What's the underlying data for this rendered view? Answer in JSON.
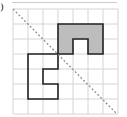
{
  "figure": {
    "label": ")",
    "grid": {
      "cols": 7,
      "rows": 7,
      "origin_x": 13,
      "origin_y": 9,
      "cell": 15,
      "line_color": "#d4d4d4"
    },
    "mirror_line": {
      "style": "dashed",
      "color": "#888888",
      "from": [
        13,
        9
      ],
      "to": [
        117,
        114
      ]
    },
    "shaded_shape": {
      "fill": "#bdbdbd",
      "stroke": "#222222",
      "cells_outline": [
        [
          3,
          1
        ],
        [
          6,
          1
        ],
        [
          6,
          3
        ],
        [
          5,
          3
        ],
        [
          5,
          2
        ],
        [
          4,
          2
        ],
        [
          4,
          3
        ],
        [
          3,
          3
        ]
      ]
    },
    "white_shape": {
      "fill": "none",
      "stroke": "#222222",
      "cells_outline": [
        [
          1,
          3
        ],
        [
          3,
          3
        ],
        [
          3,
          4
        ],
        [
          2,
          4
        ],
        [
          2,
          5
        ],
        [
          3,
          5
        ],
        [
          3,
          6
        ],
        [
          1,
          6
        ]
      ]
    }
  }
}
